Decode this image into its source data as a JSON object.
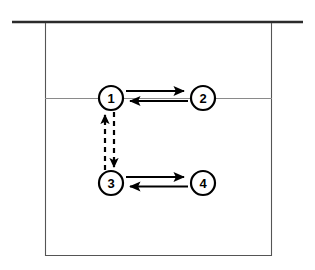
{
  "figure": {
    "type": "diagram",
    "background_color": "#ffffff",
    "frame": {
      "top_rule": {
        "name": "top-horizontal-rule",
        "x1": 12,
        "x2": 303,
        "y": 22,
        "stroke": "#2b2b2b",
        "stroke_width": 2.6
      },
      "box": {
        "name": "enclosing-box",
        "left": 45,
        "right": 272,
        "top": 22,
        "bottom": 256,
        "stroke": "#555555",
        "stroke_width": 1.1
      },
      "interface_line": {
        "name": "horizontal-interface-line",
        "x1": 45,
        "x2": 272,
        "y": 98,
        "stroke": "#8a8a8a",
        "stroke_width": 1.0
      }
    },
    "nodes": [
      {
        "id": "node-1",
        "label": "1",
        "cx": 111,
        "cy": 98,
        "r": 12
      },
      {
        "id": "node-2",
        "label": "2",
        "cx": 203,
        "cy": 98,
        "r": 12
      },
      {
        "id": "node-3",
        "label": "3",
        "cx": 111,
        "cy": 183,
        "r": 12
      },
      {
        "id": "node-4",
        "label": "4",
        "cx": 203,
        "cy": 183,
        "r": 12
      }
    ],
    "node_style": {
      "fill": "#ffffff",
      "stroke": "#000000",
      "stroke_width": 2.2
    },
    "edges": [
      {
        "id": "edge-1-to-2",
        "from": "1",
        "to": "2",
        "style": "solid",
        "direction": "right",
        "x1": 126,
        "x2": 186,
        "y": 91
      },
      {
        "id": "edge-2-to-1",
        "from": "2",
        "to": "1",
        "style": "solid",
        "direction": "left",
        "x1": 188,
        "x2": 128,
        "y": 101
      },
      {
        "id": "edge-3-to-4",
        "from": "3",
        "to": "4",
        "style": "solid",
        "direction": "right",
        "x1": 126,
        "x2": 186,
        "y": 177
      },
      {
        "id": "edge-4-to-3",
        "from": "4",
        "to": "3",
        "style": "solid",
        "direction": "left",
        "x1": 188,
        "x2": 128,
        "y": 186
      },
      {
        "id": "edge-3-to-1",
        "from": "3",
        "to": "1",
        "style": "dashed",
        "direction": "up",
        "x": 105,
        "y1": 170,
        "y2": 112
      },
      {
        "id": "edge-1-to-3",
        "from": "1",
        "to": "3",
        "style": "dashed",
        "direction": "down",
        "x": 114,
        "y1": 112,
        "y2": 170
      }
    ],
    "edge_style": {
      "solid_stroke": "#000000",
      "solid_stroke_width": 2.2,
      "dashed_stroke": "#000000",
      "dashed_stroke_width": 2.2,
      "dash_pattern": "5 4",
      "arrowhead_color": "#000000"
    }
  }
}
